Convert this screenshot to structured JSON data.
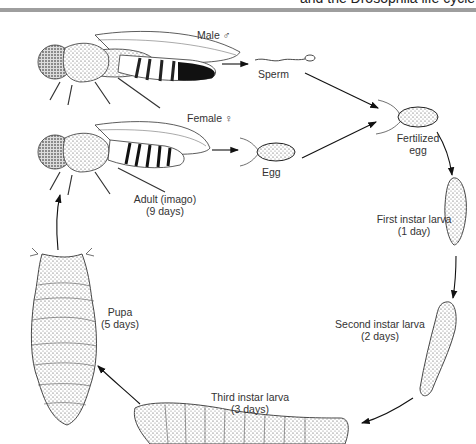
{
  "header": {
    "cut_text": "and the Drosophila life cycle"
  },
  "diagram": {
    "title": "Drosophila life cycle",
    "labels": {
      "male": "Male ♂",
      "female": "Female ♀",
      "sperm": "Sperm",
      "egg": "Egg",
      "fertilized_1": "Fertilized",
      "fertilized_2": "egg",
      "adult_1": "Adult (imago)",
      "adult_2": "(9 days)",
      "first_1": "First instar larva",
      "first_2": "(1 day)",
      "second_1": "Second instar larva",
      "second_2": "(2 days)",
      "third_1": "Third instar larva",
      "third_2": "(3 days)",
      "pupa_1": "Pupa",
      "pupa_2": "(5 days)"
    },
    "stages": [
      {
        "name": "Adult (imago)",
        "duration": "9 days"
      },
      {
        "name": "Fertilized egg",
        "duration": ""
      },
      {
        "name": "First instar larva",
        "duration": "1 day"
      },
      {
        "name": "Second instar larva",
        "duration": "2 days"
      },
      {
        "name": "Third instar larva",
        "duration": "3 days"
      },
      {
        "name": "Pupa",
        "duration": "5 days"
      }
    ]
  }
}
